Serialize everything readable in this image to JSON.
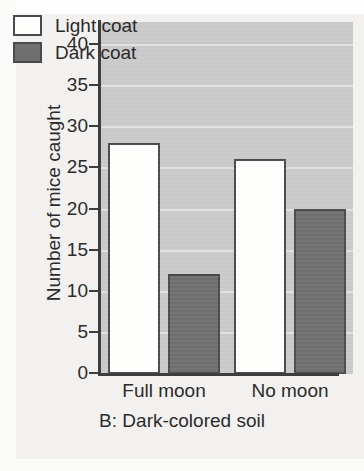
{
  "chart_data": {
    "type": "bar",
    "title": "",
    "caption": "B: Dark-colored soil",
    "xlabel": "",
    "ylabel": "Number of mice caught",
    "categories": [
      "Full moon",
      "No moon"
    ],
    "series": [
      {
        "name": "Light coat",
        "values": [
          28,
          26
        ],
        "color": "#fdfdfb",
        "edge_color": "#4a4a4a"
      },
      {
        "name": "Dark coat",
        "values": [
          12,
          20
        ],
        "color": "#6f6f6f",
        "edge_color": "#4a4a4a"
      }
    ],
    "ylim": [
      0,
      40
    ],
    "ytick_values": [
      0,
      5,
      10,
      15,
      20,
      25,
      30,
      35,
      40
    ],
    "ytick_labels": [
      "0",
      "5",
      "10",
      "15",
      "20",
      "25",
      "30",
      "35",
      "40"
    ],
    "grid": true,
    "grid_orientation": "horizontal",
    "legend_position": "top-left-inside",
    "plot_background": "#c9c9c9",
    "page_background": "#f2f1ef"
  },
  "axis": {
    "y_title": "Number of mice caught"
  },
  "legend": {
    "items": [
      {
        "label": "Light coat",
        "swatch": "light"
      },
      {
        "label": "Dark coat",
        "swatch": "dark"
      }
    ]
  },
  "x_labels": [
    "Full moon",
    "No moon"
  ],
  "caption": "B: Dark-colored soil"
}
